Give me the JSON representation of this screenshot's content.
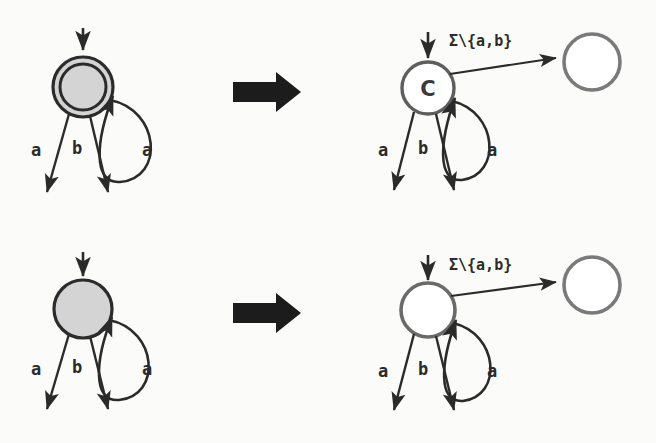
{
  "figure": {
    "background_color": "#fbfbfa",
    "ink_dark": "#2b2b2b",
    "ink_gray": "#6e6e6e",
    "state_fill_gray": "#d4d4d4",
    "state_fill_white": "#ffffff",
    "big_arrow_color": "#1c1c1c",
    "type": "state-machine-transformation-diagram"
  },
  "rows": [
    {
      "id": "row-accepting",
      "before": {
        "state": {
          "shape": "double-circle",
          "accepting": true,
          "fill": "#d4d4d4",
          "stroke": "#2b2b2b",
          "label": ""
        },
        "incoming_arrow": true,
        "self_loop_label": "a",
        "out_labels": [
          "a",
          "b"
        ]
      },
      "transform_arrow": "➡",
      "after": {
        "state": {
          "shape": "circle",
          "accepting": false,
          "fill": "#ffffff",
          "stroke": "#5e5e5e",
          "label": "C"
        },
        "incoming_arrow": true,
        "self_loop_label": "a",
        "out_labels": [
          "a",
          "b"
        ],
        "sink_edge_label": "Σ\\{a,b}",
        "sink_state": {
          "shape": "circle",
          "fill": "#ffffff",
          "stroke": "#7a7a7a",
          "label": ""
        }
      }
    },
    {
      "id": "row-nonaccepting",
      "before": {
        "state": {
          "shape": "circle",
          "accepting": false,
          "fill": "#d4d4d4",
          "stroke": "#2b2b2b",
          "label": ""
        },
        "incoming_arrow": true,
        "self_loop_label": "a",
        "out_labels": [
          "a",
          "b"
        ]
      },
      "transform_arrow": "➡",
      "after": {
        "state": {
          "shape": "circle",
          "accepting": false,
          "fill": "#ffffff",
          "stroke": "#6a6a6a",
          "label": ""
        },
        "incoming_arrow": true,
        "self_loop_label": "a",
        "out_labels": [
          "a",
          "b"
        ],
        "sink_edge_label": "Σ\\{a,b}",
        "sink_state": {
          "shape": "circle",
          "fill": "#ffffff",
          "stroke": "#7a7a7a",
          "label": ""
        }
      }
    }
  ]
}
